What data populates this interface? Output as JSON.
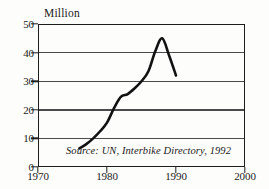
{
  "chart_data": {
    "type": "line",
    "title": "",
    "xlabel": "",
    "ylabel": "Million",
    "ylim": [
      0,
      50
    ],
    "xlim": [
      1970,
      2000
    ],
    "grid": true,
    "legend": "none",
    "yticks": [
      0,
      10,
      20,
      30,
      40,
      50
    ],
    "xticks": [
      1970,
      1980,
      1990,
      2000
    ],
    "ytick_labels": [
      "0",
      "10",
      "20",
      "30",
      "40",
      "50"
    ],
    "xtick_labels": [
      "1970",
      "1980",
      "1990",
      "2000"
    ],
    "annotation": "Source: UN, Interbike Directory, 1992",
    "series": [
      {
        "name": "Bicycle production",
        "x": [
          1976,
          1977,
          1978,
          1979,
          1980,
          1981,
          1982,
          1983,
          1984,
          1985,
          1986,
          1987,
          1988,
          1989,
          1990
        ],
        "values": [
          6.5,
          8.0,
          10.0,
          12.5,
          15.5,
          20.5,
          24.5,
          25.5,
          27.5,
          30.0,
          33.5,
          40.5,
          45.0,
          39.0,
          32.0
        ]
      }
    ]
  },
  "axis": {
    "y_title": "Million",
    "y_labels": [
      "50",
      "40",
      "30",
      "20",
      "10",
      "0"
    ],
    "x_labels": [
      "1970",
      "1980",
      "1990",
      "2000"
    ]
  },
  "source": {
    "note": "Source: UN, Interbike Directory, 1992"
  },
  "colors": {
    "line": "#121212",
    "grid": "#4a4a4a",
    "frame": "#1d1d1d",
    "background": "#fdfdfb"
  }
}
